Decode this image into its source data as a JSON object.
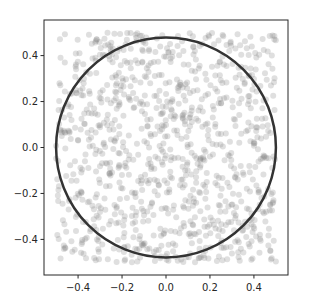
{
  "chart_data": {
    "type": "scatter",
    "title": "",
    "xlabel": "",
    "ylabel": "",
    "xlim": [
      -0.555,
      0.555
    ],
    "ylim": [
      -0.555,
      0.555
    ],
    "xticks": [
      -0.4,
      -0.2,
      0.0,
      0.2,
      0.4
    ],
    "xtick_labels": [
      "−0.4",
      "−0.2",
      "0.0",
      "0.2",
      "0.4"
    ],
    "yticks": [
      -0.4,
      -0.2,
      0.0,
      0.2,
      0.4
    ],
    "ytick_labels": [
      "−0.4",
      "−0.2",
      "0.0",
      "0.2",
      "0.4"
    ],
    "grid": false,
    "legend": null,
    "aspect": "equal",
    "series": [
      {
        "name": "random points",
        "kind": "scatter",
        "color": "#808080",
        "alpha": 0.25,
        "marker_radius_px": 3,
        "count": 1000,
        "distribution": "uniform in [-0.5, 0.5] x [-0.5, 0.5]",
        "seed": 12345
      },
      {
        "name": "circle",
        "kind": "circle",
        "center": [
          0.0,
          0.0
        ],
        "radius": 0.5,
        "color": "#333333",
        "line_width_px": 2.5
      }
    ]
  },
  "axes": {
    "frame_color": "#262626",
    "text_color": "#262626"
  }
}
